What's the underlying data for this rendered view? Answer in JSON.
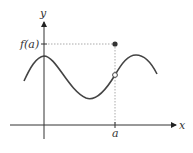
{
  "diagram": {
    "axes": {
      "x_label": "x",
      "y_label": "y"
    },
    "labels": {
      "tick_x": "a",
      "tick_y": "f(a)"
    },
    "points": [
      {
        "name": "defined-value",
        "style": "filled",
        "label": "(a, f(a))"
      },
      {
        "name": "hole",
        "style": "open",
        "label": "limit point"
      }
    ],
    "colors": {
      "curve": "#444444",
      "axis": "#333333",
      "guide": "#aaaaaa"
    }
  }
}
